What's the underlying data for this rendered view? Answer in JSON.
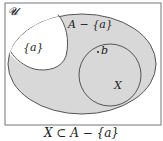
{
  "diagram": {
    "type": "venn",
    "universe_label": "𝓤",
    "regions": {
      "A_minus_a": {
        "label": "A − {a}",
        "fill": "#d8d8d8"
      },
      "singleton_a": {
        "label": "{a}",
        "fill": "#ffffff"
      },
      "X": {
        "label": "X",
        "fill": "#d8d8d8"
      }
    },
    "points": [
      {
        "label": "b",
        "marker": "."
      }
    ],
    "colors": {
      "stroke": "#555555",
      "background": "#ffffff",
      "shaded": "#d8d8d8"
    }
  },
  "caption": "X ⊂ A − {a}"
}
